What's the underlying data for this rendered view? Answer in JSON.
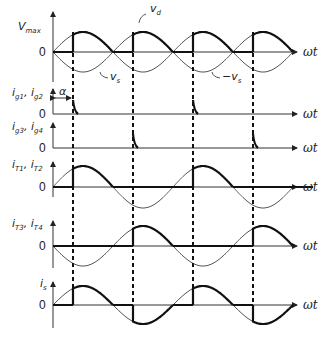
{
  "diagram": {
    "type": "waveform",
    "x_axis_label": "ωt",
    "zero_label": "0",
    "alpha_label": "α",
    "firing_positions_px": [
      73,
      133,
      193,
      253
    ],
    "half_period_px": 60,
    "origin_x": 53,
    "end_x": 293,
    "panels": [
      {
        "id": "vd",
        "y_label": "V",
        "y_label_sub": "max",
        "baseline": 52,
        "amplitude": 20,
        "annotations": [
          {
            "text": "v",
            "sub": "d",
            "x": 148,
            "y": 11
          },
          {
            "text": "v",
            "sub": "s",
            "x": 108,
            "y": 77
          },
          {
            "text": "−v",
            "sub": "s",
            "x": 220,
            "y": 77
          }
        ]
      },
      {
        "id": "ig12",
        "y_label": "i",
        "y_label_sub1": "g1",
        "y_label_sub2": "g2",
        "baseline": 114
      },
      {
        "id": "ig34",
        "y_label": "i",
        "y_label_sub1": "g3",
        "y_label_sub2": "g4",
        "baseline": 148
      },
      {
        "id": "iT12",
        "y_label": "i",
        "y_label_sub1": "T1",
        "y_label_sub2": "T2",
        "baseline": 187,
        "amplitude": 21
      },
      {
        "id": "iT34",
        "y_label": "i",
        "y_label_sub1": "T3",
        "y_label_sub2": "T4",
        "baseline": 246,
        "amplitude": 20
      },
      {
        "id": "is",
        "y_label": "i",
        "y_label_sub": "s",
        "baseline": 305,
        "amplitude": 19
      }
    ]
  },
  "labels": {
    "vmax_main": "V",
    "vmax_sub": "max",
    "zero": "0",
    "wt": "ωt",
    "alpha": "α",
    "vd_main": "v",
    "vd_sub": "d",
    "vs_main": "v",
    "vs_sub": "s",
    "nvs_main": "−v",
    "nvs_sub": "s",
    "ig12_main": "i",
    "ig12_s1": "g1",
    "ig12_s2": "g2",
    "ig34_main": "i",
    "ig34_s1": "g3",
    "ig34_s2": "g4",
    "iT12_main": "i",
    "iT12_s1": "T1",
    "iT12_s2": "T2",
    "iT34_main": "i",
    "iT34_s1": "T3",
    "iT34_s2": "T4",
    "is_main": "i",
    "is_sub": "s",
    "comma": ", "
  }
}
